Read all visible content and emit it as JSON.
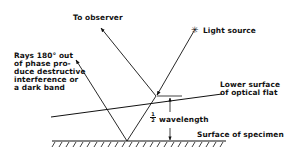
{
  "diagram": {
    "type": "optical flat interference",
    "labels": {
      "observer": "To observer",
      "light_source": "Light source",
      "light_source_symbol": "✳",
      "rays_line1": "Rays 180° out",
      "rays_line2": "of phase pro-",
      "rays_line3": "duce destructive",
      "rays_line4": "interference or",
      "rays_line5": "a dark band",
      "flat_line1": "Lower surface",
      "flat_line2": "of optical flat",
      "half": "1/2",
      "half_num": "1",
      "half_den": "2",
      "wavelength": "wavelength",
      "specimen": "Surface of specimen"
    },
    "colors": {
      "ink": "#111111",
      "background": "#ffffff"
    }
  }
}
